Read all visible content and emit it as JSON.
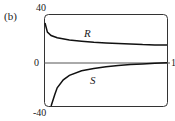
{
  "figure": {
    "panel_label": "(b)"
  },
  "chart_data": {
    "type": "line",
    "title": "",
    "xlabel": "",
    "ylabel": "",
    "ylim": [
      -40,
      40
    ],
    "xlim": [
      0,
      1
    ],
    "y_tick_labels": [
      "40",
      "0",
      "-40"
    ],
    "x_tick_labels": [
      "1"
    ],
    "grid": false,
    "legend": "none (curves labeled inline)",
    "series": [
      {
        "name": "R",
        "x": [
          0.0,
          0.02,
          0.05,
          0.1,
          0.2,
          0.3,
          0.4,
          0.5,
          0.6,
          0.7,
          0.8,
          0.9,
          1.0
        ],
        "y": [
          33,
          25,
          22,
          20,
          18,
          17,
          16,
          15.5,
          15,
          14.5,
          14,
          13.7,
          13.5
        ]
      },
      {
        "name": "S",
        "x": [
          0.05,
          0.08,
          0.1,
          0.15,
          0.2,
          0.3,
          0.4,
          0.5,
          0.6,
          0.7,
          0.8,
          0.9,
          1.0
        ],
        "y": [
          -40,
          -30,
          -24,
          -17,
          -13,
          -9,
          -7,
          -5.5,
          -4.5,
          -3.5,
          -3,
          -2.5,
          -2
        ]
      }
    ],
    "annotations": [
      {
        "text": "R",
        "x": 0.4,
        "y": 25
      },
      {
        "text": "S",
        "x": 0.45,
        "y": -18
      }
    ]
  }
}
